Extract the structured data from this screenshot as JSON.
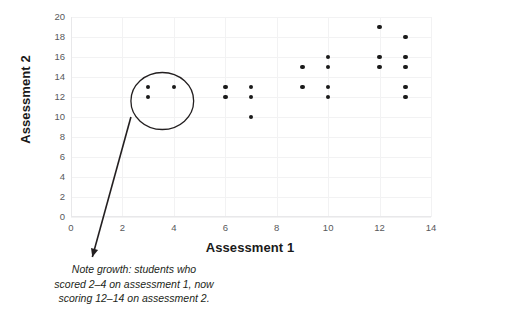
{
  "chart_data": {
    "type": "scatter",
    "title": "",
    "xlabel": "Assessment 1",
    "ylabel": "Assessment 2",
    "xlim": [
      0,
      14
    ],
    "ylim": [
      0,
      20
    ],
    "xticks": [
      0,
      2,
      4,
      6,
      8,
      10,
      12,
      14
    ],
    "yticks": [
      0,
      2,
      4,
      6,
      8,
      10,
      12,
      14,
      16,
      18,
      20
    ],
    "grid": true,
    "legend": null,
    "point_color": "#1a1a1a",
    "points": [
      {
        "x": 3,
        "y": 13
      },
      {
        "x": 3,
        "y": 12
      },
      {
        "x": 4,
        "y": 13
      },
      {
        "x": 6,
        "y": 13
      },
      {
        "x": 6,
        "y": 12
      },
      {
        "x": 7,
        "y": 13
      },
      {
        "x": 7,
        "y": 12
      },
      {
        "x": 7,
        "y": 10
      },
      {
        "x": 9,
        "y": 15
      },
      {
        "x": 9,
        "y": 13
      },
      {
        "x": 10,
        "y": 16
      },
      {
        "x": 10,
        "y": 15
      },
      {
        "x": 10,
        "y": 13
      },
      {
        "x": 10,
        "y": 12
      },
      {
        "x": 12,
        "y": 19
      },
      {
        "x": 12,
        "y": 16
      },
      {
        "x": 12,
        "y": 15
      },
      {
        "x": 13,
        "y": 18
      },
      {
        "x": 13,
        "y": 16
      },
      {
        "x": 13,
        "y": 15
      },
      {
        "x": 13,
        "y": 13
      },
      {
        "x": 13,
        "y": 12
      }
    ],
    "annotations": [
      {
        "type": "ellipse-callout",
        "text": "Note growth: students who scored 2–4 on assessment 1, now scoring 12–14 on assessment 2.",
        "text_line_1": "Note growth: students who",
        "text_line_2": "scored 2–4 on assessment 1, now",
        "text_line_3": "scoring 12–14 on assessment 2.",
        "ellipse_center_x": 3.55,
        "ellipse_center_y": 11.6,
        "ellipse_rx": 1.22,
        "ellipse_ry": 2.85,
        "leader_from_x": 2.33,
        "leader_from_y": 10.0,
        "leader_to_x": 0.83,
        "leader_to_y": -4.0
      }
    ]
  }
}
